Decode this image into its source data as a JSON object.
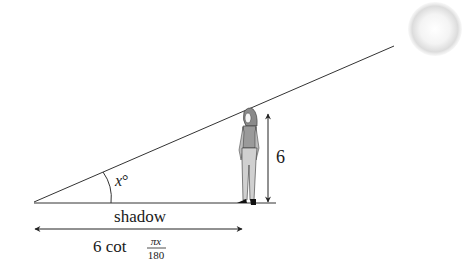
{
  "diagram": {
    "angle_label": "x°",
    "angle_var": "x",
    "angle_unit": "°",
    "height_label": "6",
    "shadow_label": "shadow",
    "shadow_formula": {
      "prefix": "6 cot",
      "numerator": "πx",
      "denominator": "180"
    },
    "elements": {
      "sun": "sun-icon",
      "person": "person-figure"
    },
    "colors": {
      "line": "#333333",
      "sun_edge": "#c8c8c8",
      "sun_center": "#ffffff"
    }
  }
}
